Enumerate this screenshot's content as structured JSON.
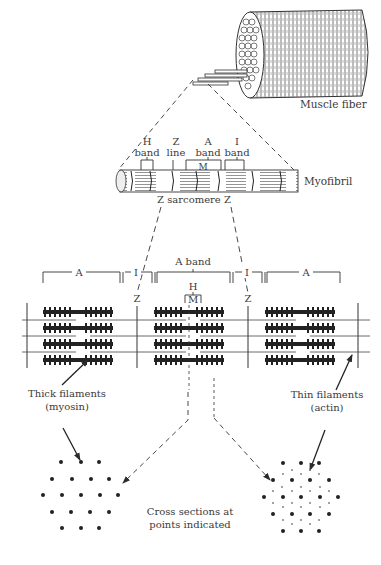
{
  "figure": {
    "colors": {
      "ink": "#2a2a2a",
      "text": "#3a3a3a",
      "background": "#ffffff"
    }
  },
  "fiber": {
    "label": "Muscle fiber"
  },
  "myofibril": {
    "label": "Myofibril",
    "bands": [
      {
        "line1": "H",
        "line2": "band"
      },
      {
        "line1": "Z",
        "line2": "line"
      },
      {
        "line1": "A",
        "line2": "band"
      },
      {
        "line1": "I",
        "line2": "band"
      }
    ],
    "m_label": "M",
    "sarcomere_label": "Z sarcomere Z"
  },
  "sarcomere": {
    "left_a": "A",
    "left_i": "I",
    "a_band": "A band",
    "right_i": "I",
    "right_a": "A",
    "h_label": "H",
    "m_label": "M",
    "z_left": "Z",
    "z_right": "Z",
    "rows": 4
  },
  "labels": {
    "thick_line1": "Thick filaments",
    "thick_line2": "(myosin)",
    "thin_line1": "Thin filaments",
    "thin_line2": "(actin)",
    "cross_line1": "Cross sections at",
    "cross_line2": "points indicated"
  }
}
